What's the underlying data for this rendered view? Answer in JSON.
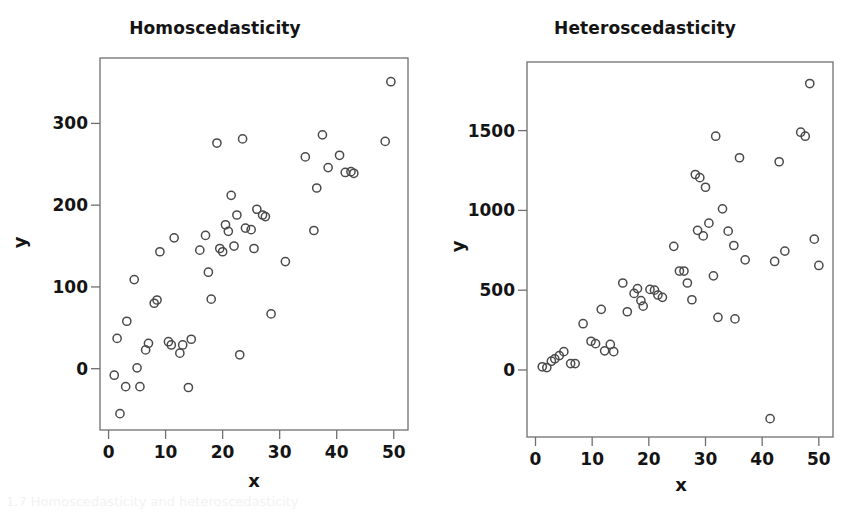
{
  "figure": {
    "background": "#ffffff",
    "marker_color": "#4a4a4a",
    "axis_color": "#6f6f6f",
    "text_color": "#141414",
    "caption_partial": "1.7  Homoscedasticity and heteroscedasticity"
  },
  "panels": [
    {
      "id": "homoscedasticity",
      "title": "Homoscedasticity",
      "xlabel": "x",
      "ylabel": "y"
    },
    {
      "id": "heteroscedasticity",
      "title": "Heteroscedasticity",
      "xlabel": "x",
      "ylabel": "y"
    }
  ],
  "chart_data": [
    {
      "type": "scatter",
      "title": "Homoscedasticity",
      "xlabel": "x",
      "ylabel": "y",
      "xlim": [
        -1.5,
        52.5
      ],
      "ylim": [
        -75,
        380
      ],
      "xticks": [
        0,
        10,
        20,
        30,
        40,
        50
      ],
      "yticks": [
        0,
        100,
        200,
        300
      ],
      "xticklabels": [
        "0",
        "10",
        "20",
        "30",
        "40",
        "50"
      ],
      "yticklabels": [
        "0",
        "100",
        "200",
        "300"
      ],
      "grid": false,
      "legend": null,
      "marker": "open-circle",
      "n_points": 50,
      "points": [
        [
          1.0,
          -8
        ],
        [
          1.5,
          37
        ],
        [
          2.0,
          -55
        ],
        [
          3.0,
          -22
        ],
        [
          3.2,
          58
        ],
        [
          4.5,
          109
        ],
        [
          5.0,
          1
        ],
        [
          5.5,
          -22
        ],
        [
          6.5,
          23
        ],
        [
          7.0,
          31
        ],
        [
          8.0,
          80
        ],
        [
          8.5,
          84
        ],
        [
          9.0,
          143
        ],
        [
          10.5,
          33
        ],
        [
          11.0,
          29
        ],
        [
          11.5,
          160
        ],
        [
          12.5,
          19
        ],
        [
          13.0,
          29
        ],
        [
          14.0,
          -23
        ],
        [
          14.5,
          36
        ],
        [
          16.0,
          145
        ],
        [
          17.0,
          163
        ],
        [
          17.5,
          118
        ],
        [
          18.0,
          85
        ],
        [
          19.0,
          276
        ],
        [
          19.5,
          147
        ],
        [
          20.0,
          143
        ],
        [
          20.5,
          176
        ],
        [
          21.0,
          168
        ],
        [
          21.5,
          212
        ],
        [
          22.0,
          150
        ],
        [
          22.5,
          188
        ],
        [
          23.0,
          17
        ],
        [
          23.5,
          281
        ],
        [
          24.0,
          172
        ],
        [
          25.0,
          170
        ],
        [
          25.5,
          147
        ],
        [
          26.0,
          195
        ],
        [
          27.0,
          188
        ],
        [
          27.5,
          186
        ],
        [
          28.5,
          67
        ],
        [
          31.0,
          131
        ],
        [
          34.5,
          259
        ],
        [
          36.0,
          169
        ],
        [
          36.5,
          221
        ],
        [
          37.5,
          286
        ],
        [
          38.5,
          246
        ],
        [
          40.5,
          261
        ],
        [
          41.5,
          240
        ],
        [
          42.5,
          241
        ],
        [
          43.0,
          239
        ],
        [
          48.5,
          278
        ],
        [
          49.5,
          351
        ]
      ]
    },
    {
      "type": "scatter",
      "title": "Heteroscedasticity",
      "xlabel": "x",
      "ylabel": "y",
      "xlim": [
        -1.5,
        52.5
      ],
      "ylim": [
        -420,
        1930
      ],
      "xticks": [
        0,
        10,
        20,
        30,
        40,
        50
      ],
      "yticks": [
        0,
        500,
        1000,
        1500
      ],
      "xticklabels": [
        "0",
        "10",
        "20",
        "30",
        "40",
        "50"
      ],
      "yticklabels": [
        "0",
        "500",
        "1000",
        "1500"
      ],
      "grid": false,
      "legend": null,
      "marker": "open-circle",
      "n_points": 50,
      "points": [
        [
          1.2,
          20
        ],
        [
          2.0,
          15
        ],
        [
          2.8,
          55
        ],
        [
          3.4,
          70
        ],
        [
          4.2,
          90
        ],
        [
          5.0,
          115
        ],
        [
          6.2,
          40
        ],
        [
          7.0,
          40
        ],
        [
          8.4,
          290
        ],
        [
          9.8,
          180
        ],
        [
          10.6,
          165
        ],
        [
          11.6,
          380
        ],
        [
          12.2,
          120
        ],
        [
          13.2,
          160
        ],
        [
          13.8,
          115
        ],
        [
          15.4,
          545
        ],
        [
          16.2,
          365
        ],
        [
          17.4,
          480
        ],
        [
          18.0,
          510
        ],
        [
          18.6,
          435
        ],
        [
          19.0,
          400
        ],
        [
          20.2,
          505
        ],
        [
          21.0,
          500
        ],
        [
          21.6,
          470
        ],
        [
          22.4,
          455
        ],
        [
          24.4,
          775
        ],
        [
          25.4,
          620
        ],
        [
          26.2,
          620
        ],
        [
          26.8,
          545
        ],
        [
          27.6,
          440
        ],
        [
          28.2,
          1225
        ],
        [
          29.0,
          1205
        ],
        [
          30.0,
          1145
        ],
        [
          28.6,
          875
        ],
        [
          29.6,
          840
        ],
        [
          30.6,
          920
        ],
        [
          31.4,
          590
        ],
        [
          31.8,
          1465
        ],
        [
          32.2,
          330
        ],
        [
          33.0,
          1010
        ],
        [
          34.0,
          870
        ],
        [
          35.2,
          320
        ],
        [
          35.0,
          780
        ],
        [
          36.0,
          1330
        ],
        [
          37.0,
          690
        ],
        [
          41.4,
          -305
        ],
        [
          42.2,
          680
        ],
        [
          43.0,
          1305
        ],
        [
          44.0,
          745
        ],
        [
          46.8,
          1490
        ],
        [
          47.6,
          1465
        ],
        [
          48.4,
          1795
        ],
        [
          49.2,
          820
        ],
        [
          50.0,
          655
        ]
      ]
    }
  ]
}
